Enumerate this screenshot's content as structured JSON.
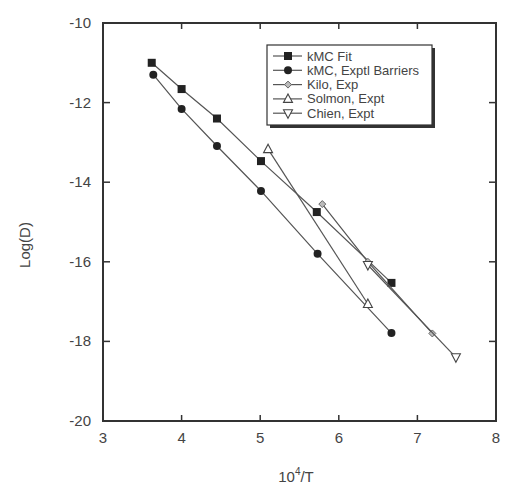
{
  "chart_data": {
    "type": "line",
    "title": "",
    "xlabel": "10^4/T",
    "xlabel_base": "10",
    "xlabel_sup": "4",
    "xlabel_rest": "/T",
    "ylabel": "Log(D)",
    "xlim": [
      3,
      8
    ],
    "ylim": [
      -20,
      -10
    ],
    "xticks": [
      3,
      4,
      5,
      6,
      7,
      8
    ],
    "yticks": [
      -10,
      -12,
      -14,
      -16,
      -18,
      -20
    ],
    "grid": false,
    "legend_position": "upper right",
    "series": [
      {
        "name": "kMC Fit",
        "marker": "filled-square",
        "x": [
          3.62,
          4.0,
          4.45,
          5.01,
          5.72,
          6.67
        ],
        "y": [
          -11.0,
          -11.66,
          -12.4,
          -13.47,
          -14.75,
          -16.53
        ]
      },
      {
        "name": "kMC, Exptl Barriers",
        "marker": "filled-circle",
        "x": [
          3.64,
          4.0,
          4.45,
          5.01,
          5.73,
          6.67
        ],
        "y": [
          -11.3,
          -12.16,
          -13.09,
          -14.22,
          -15.8,
          -17.79
        ]
      },
      {
        "name": "Kilo, Exp",
        "marker": "small-diamond",
        "x": [
          5.79,
          6.37,
          7.19
        ],
        "y": [
          -14.55,
          -16.0,
          -17.8
        ]
      },
      {
        "name": "Solmon, Expt",
        "marker": "open-triangle-up",
        "x": [
          5.1,
          6.37
        ],
        "y": [
          -13.17,
          -17.06
        ]
      },
      {
        "name": "Chien, Expt",
        "marker": "open-triangle-down",
        "x": [
          6.37,
          7.49
        ],
        "y": [
          -16.08,
          -18.4
        ]
      }
    ]
  }
}
